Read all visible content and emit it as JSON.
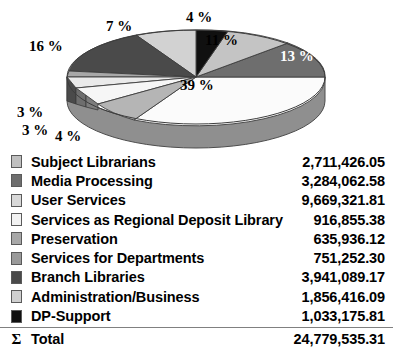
{
  "chart_data": {
    "type": "pie",
    "title": "",
    "legend_position": "bottom",
    "value_unit": "currency",
    "total_label": "Total",
    "total_value": "24,779,535.31",
    "total_icon": "Σ",
    "categories": [
      "Subject Librarians",
      "Media Processing",
      "User Services",
      "Services as Regional Deposit Library",
      "Preservation",
      "Services for Departments",
      "Branch Libraries",
      "Administration/Business",
      "DP-Support"
    ],
    "values": [
      2711426.05,
      3284062.58,
      9669321.81,
      916855.38,
      635936.12,
      751252.3,
      3941089.17,
      1856416.09,
      1033175.81
    ],
    "value_labels": [
      "2,711,426.05",
      "3,284,062.58",
      "9,669,321.81",
      "916,855.38",
      "635,936.12",
      "751,252.30",
      "3,941,089.17",
      "1,856,416.09",
      "1,033,175.81"
    ],
    "percentages": [
      11,
      13,
      39,
      4,
      3,
      3,
      16,
      7,
      4
    ],
    "percent_labels": [
      "11 %",
      "13 %",
      "39 %",
      "4 %",
      "3 %",
      "3 %",
      "16 %",
      "7 %",
      "4 %"
    ],
    "colors": [
      "#c0c0c0",
      "#6e6e6e",
      "#d8d8d8",
      "#f2f2f2",
      "#a8a8a8",
      "#9a9a9a",
      "#4a4a4a",
      "#cfcfcf",
      "#101010"
    ]
  },
  "legend": {
    "rows": [
      {
        "label": "Subject Librarians",
        "value": "2,711,426.05",
        "color": "#c0c0c0"
      },
      {
        "label": "Media Processing",
        "value": "3,284,062.58",
        "color": "#6e6e6e"
      },
      {
        "label": "User Services",
        "value": "9,669,321.81",
        "color": "#d8d8d8"
      },
      {
        "label": "Services as Regional Deposit Library",
        "value": "916,855.38",
        "color": "#f2f2f2"
      },
      {
        "label": "Preservation",
        "value": "635,936.12",
        "color": "#a8a8a8"
      },
      {
        "label": "Services for Departments",
        "value": "751,252.30",
        "color": "#9a9a9a"
      },
      {
        "label": "Branch Libraries",
        "value": "3,941,089.17",
        "color": "#4a4a4a"
      },
      {
        "label": "Administration/Business",
        "value": "1,856,416.09",
        "color": "#cfcfcf"
      },
      {
        "label": "DP-Support",
        "value": "1,033,175.81",
        "color": "#101010"
      }
    ],
    "total": {
      "icon": "Σ",
      "label": "Total",
      "value": "24,779,535.31"
    }
  },
  "pie_labels": [
    {
      "text": "4 %",
      "x": 186,
      "y": 10,
      "tone": "dark"
    },
    {
      "text": "7 %",
      "x": 106,
      "y": 19,
      "tone": "dark"
    },
    {
      "text": "11 %",
      "x": 205,
      "y": 33,
      "tone": "dark"
    },
    {
      "text": "16 %",
      "x": 29,
      "y": 39,
      "tone": "dark"
    },
    {
      "text": "13 %",
      "x": 280,
      "y": 49,
      "tone": "light"
    },
    {
      "text": "39 %",
      "x": 180,
      "y": 78,
      "tone": "dark"
    },
    {
      "text": "3 %",
      "x": 17,
      "y": 105,
      "tone": "dark"
    },
    {
      "text": "3 %",
      "x": 22,
      "y": 123,
      "tone": "dark"
    },
    {
      "text": "4 %",
      "x": 55,
      "y": 129,
      "tone": "dark"
    }
  ]
}
